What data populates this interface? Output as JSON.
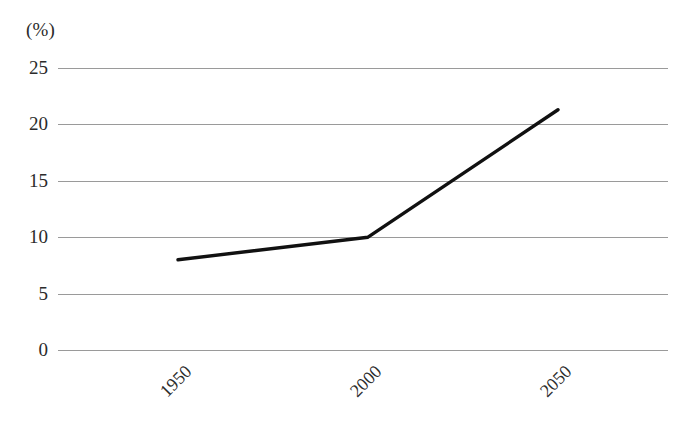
{
  "chart_data": {
    "type": "line",
    "title": "",
    "subtitle": "",
    "xlabel": "",
    "ylabel": "",
    "unit_label": "(%)",
    "x": [
      1950,
      2000,
      2050
    ],
    "categories": [
      "1950",
      "2000",
      "2050"
    ],
    "series": [
      {
        "name": "",
        "values": [
          8.0,
          10.0,
          21.3
        ]
      }
    ],
    "annotations": [],
    "legend": {
      "position": "none",
      "entries": []
    },
    "grid": {
      "horizontal": true,
      "vertical": false,
      "color": "#9a9a9a"
    },
    "xlim": [
      1946,
      2054
    ],
    "ylim": [
      0,
      25
    ],
    "ytick_labels": [
      "25",
      "20",
      "15",
      "10",
      "5",
      "0"
    ],
    "ytick_values": [
      25,
      20,
      15,
      10,
      5,
      0
    ],
    "xtick_labels": [
      "1950",
      "2000",
      "2050"
    ],
    "xtick_values": [
      1950,
      2000,
      2050
    ],
    "line_color": "#111111",
    "background_color": "#ffffff"
  },
  "axes": {
    "y": {
      "ticks": [
        {
          "label": "25",
          "value": 25
        },
        {
          "label": "20",
          "value": 20
        },
        {
          "label": "15",
          "value": 15
        },
        {
          "label": "10",
          "value": 10
        },
        {
          "label": "5",
          "value": 5
        },
        {
          "label": "0",
          "value": 0
        }
      ]
    },
    "x": {
      "ticks": [
        {
          "label": "1950",
          "value": 1950
        },
        {
          "label": "2000",
          "value": 2000
        },
        {
          "label": "2050",
          "value": 2050
        }
      ]
    }
  }
}
